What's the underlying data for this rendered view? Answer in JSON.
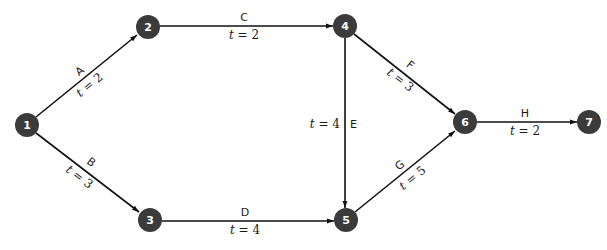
{
  "diagram": {
    "type": "network",
    "nodes": [
      {
        "id": "1",
        "label": "1",
        "x": 27,
        "y": 125
      },
      {
        "id": "2",
        "label": "2",
        "x": 148,
        "y": 27
      },
      {
        "id": "3",
        "label": "3",
        "x": 150,
        "y": 220
      },
      {
        "id": "4",
        "label": "4",
        "x": 345,
        "y": 26
      },
      {
        "id": "5",
        "label": "5",
        "x": 346,
        "y": 220
      },
      {
        "id": "6",
        "label": "6",
        "x": 465,
        "y": 122
      },
      {
        "id": "7",
        "label": "7",
        "x": 589,
        "y": 122
      }
    ],
    "edges": [
      {
        "id": "A",
        "from": "1",
        "to": "2",
        "letter": "A",
        "time_var": "t",
        "time_eq": " = 2"
      },
      {
        "id": "B",
        "from": "1",
        "to": "3",
        "letter": "B",
        "time_var": "t",
        "time_eq": " = 3"
      },
      {
        "id": "C",
        "from": "2",
        "to": "4",
        "letter": "C",
        "time_var": "t",
        "time_eq": " = 2"
      },
      {
        "id": "D",
        "from": "3",
        "to": "5",
        "letter": "D",
        "time_var": "t",
        "time_eq": " = 4"
      },
      {
        "id": "E",
        "from": "4",
        "to": "5",
        "letter": "E",
        "time_var": "t",
        "time_eq": " = 4"
      },
      {
        "id": "F",
        "from": "4",
        "to": "6",
        "letter": "F",
        "time_var": "t",
        "time_eq": " = 3"
      },
      {
        "id": "G",
        "from": "5",
        "to": "6",
        "letter": "G",
        "time_var": "t",
        "time_eq": " = 5"
      },
      {
        "id": "H",
        "from": "6",
        "to": "7",
        "letter": "H",
        "time_var": "t",
        "time_eq": " = 2"
      }
    ]
  }
}
